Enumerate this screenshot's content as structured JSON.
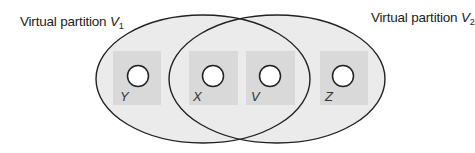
{
  "partitions": [
    {
      "id": "V1",
      "label_prefix": "Virtual partition ",
      "label_var": "V",
      "label_sub": "1",
      "ellipse": {
        "cx": 203,
        "cy": 79,
        "rx": 107,
        "ry": 64
      }
    },
    {
      "id": "V2",
      "label_prefix": "Virtual partition ",
      "label_var": "V",
      "label_sub": "2",
      "ellipse": {
        "cx": 277,
        "cy": 79,
        "rx": 108,
        "ry": 64
      }
    }
  ],
  "nodes": [
    {
      "label": "Y",
      "membership": [
        "V1"
      ]
    },
    {
      "label": "X",
      "membership": [
        "V1",
        "V2"
      ]
    },
    {
      "label": "V",
      "membership": [
        "V1",
        "V2"
      ]
    },
    {
      "label": "Z",
      "membership": [
        "V2"
      ]
    }
  ],
  "colors": {
    "ellipse_fill": "#ebebeb",
    "square_fill": "#d9d9d9",
    "stroke": "#222222",
    "circle_fill": "#ffffff"
  }
}
